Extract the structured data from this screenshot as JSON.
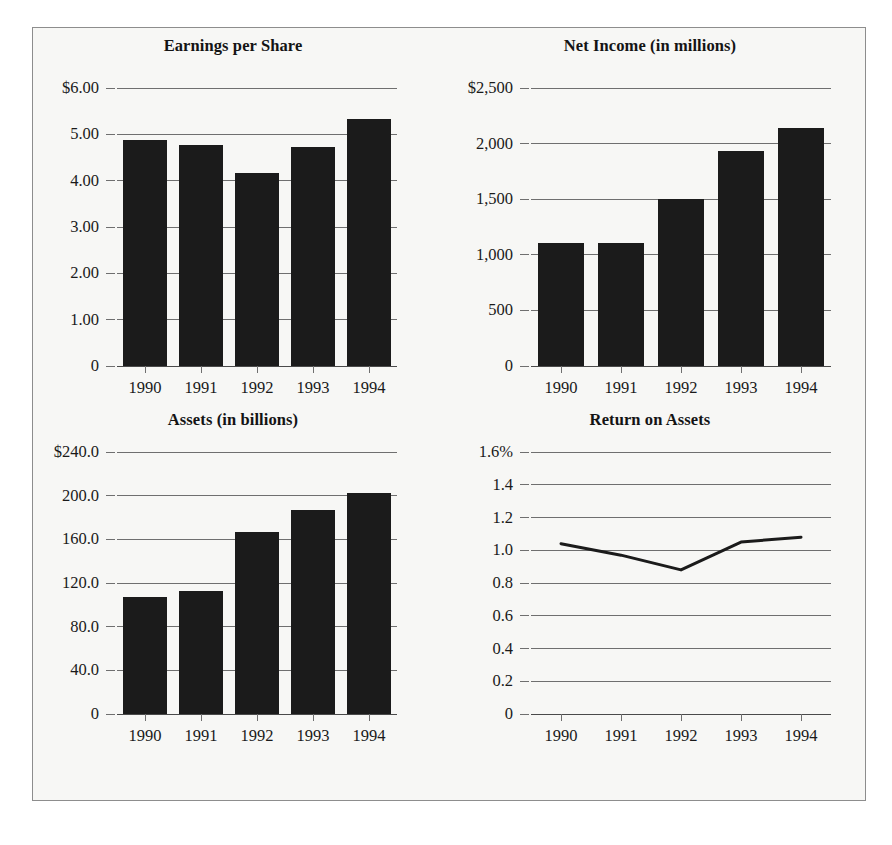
{
  "figure": {
    "background_color": "#f7f7f5",
    "border_color": "#8d8d8d",
    "bar_color": "#1b1b1b",
    "grid_color": "#6f6f6f",
    "axis_color": "#4a4a4a"
  },
  "panels": {
    "eps": {
      "title": "Earnings per Share",
      "ytick_labels": [
        "$6.00",
        "5.00",
        "4.00",
        "3.00",
        "2.00",
        "1.00",
        "0"
      ],
      "xtick_labels": [
        "1990",
        "1991",
        "1992",
        "1993",
        "1994"
      ]
    },
    "net_income": {
      "title": "Net Income (in millions)",
      "ytick_labels": [
        "$2,500",
        "2,000",
        "1,500",
        "1,000",
        "500",
        "0"
      ],
      "xtick_labels": [
        "1990",
        "1991",
        "1992",
        "1993",
        "1994"
      ]
    },
    "assets": {
      "title": "Assets (in billions)",
      "ytick_labels": [
        "$240.0",
        "200.0",
        "160.0",
        "120.0",
        "80.0",
        "40.0",
        "0"
      ],
      "xtick_labels": [
        "1990",
        "1991",
        "1992",
        "1993",
        "1994"
      ]
    },
    "roa": {
      "title": "Return on Assets",
      "ytick_labels": [
        "1.6%",
        "1.4",
        "1.2",
        "1.0",
        "0.8",
        "0.6",
        "0.4",
        "0.2",
        "0"
      ],
      "xtick_labels": [
        "1990",
        "1991",
        "1992",
        "1993",
        "1994"
      ]
    }
  },
  "chart_data": [
    {
      "type": "bar",
      "title": "Earnings per Share",
      "categories": [
        "1990",
        "1991",
        "1992",
        "1993",
        "1994"
      ],
      "values": [
        4.88,
        4.78,
        4.17,
        4.73,
        5.33
      ],
      "xlabel": "",
      "ylabel": "",
      "ylim": [
        0,
        6
      ],
      "yticks": [
        0,
        1,
        2,
        3,
        4,
        5,
        6
      ],
      "ytick_labels": [
        "0",
        "1.00",
        "2.00",
        "3.00",
        "4.00",
        "5.00",
        "$6.00"
      ],
      "grid": true,
      "legend": false
    },
    {
      "type": "bar",
      "title": "Net Income (in millions)",
      "categories": [
        "1990",
        "1991",
        "1992",
        "1993",
        "1994"
      ],
      "values": [
        1105,
        1105,
        1500,
        1930,
        2140
      ],
      "xlabel": "",
      "ylabel": "",
      "ylim": [
        0,
        2500
      ],
      "yticks": [
        0,
        500,
        1000,
        1500,
        2000,
        2500
      ],
      "ytick_labels": [
        "0",
        "500",
        "1,000",
        "1,500",
        "2,000",
        "$2,500"
      ],
      "grid": true,
      "legend": false
    },
    {
      "type": "bar",
      "title": "Assets (in billions)",
      "categories": [
        "1990",
        "1991",
        "1992",
        "1993",
        "1994"
      ],
      "values": [
        107,
        113,
        167,
        187,
        202
      ],
      "xlabel": "",
      "ylabel": "",
      "ylim": [
        0,
        240
      ],
      "yticks": [
        0,
        40,
        80,
        120,
        160,
        200,
        240
      ],
      "ytick_labels": [
        "0",
        "40.0",
        "80.0",
        "120.0",
        "160.0",
        "200.0",
        "$240.0"
      ],
      "grid": true,
      "legend": false
    },
    {
      "type": "line",
      "title": "Return on Assets",
      "x": [
        "1990",
        "1991",
        "1992",
        "1993",
        "1994"
      ],
      "values": [
        1.04,
        0.97,
        0.88,
        1.05,
        1.08
      ],
      "xlabel": "",
      "ylabel": "",
      "ylim": [
        0,
        1.6
      ],
      "yticks": [
        0,
        0.2,
        0.4,
        0.6,
        0.8,
        1.0,
        1.2,
        1.4,
        1.6
      ],
      "ytick_labels": [
        "0",
        "0.2",
        "0.4",
        "0.6",
        "0.8",
        "1.0",
        "1.2",
        "1.4",
        "1.6%"
      ],
      "grid": true,
      "legend": false
    }
  ]
}
